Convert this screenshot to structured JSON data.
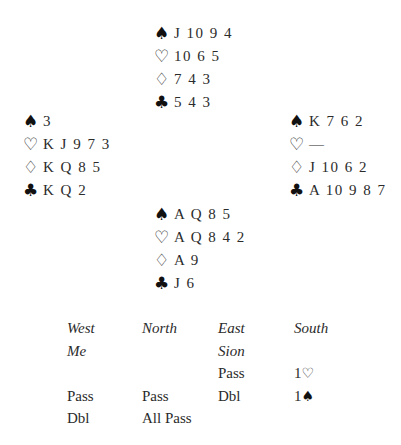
{
  "hands": {
    "north": {
      "spades": "J 10 9 4",
      "hearts": "10 6 5",
      "diamonds": "7 4 3",
      "clubs": "5 4 3"
    },
    "west": {
      "spades": "3",
      "hearts": "K J 9 7 3",
      "diamonds": "K Q 8 5",
      "clubs": "K Q 2"
    },
    "east": {
      "spades": "K 7 6 2",
      "hearts": "—",
      "diamonds": "J 10 6 2",
      "clubs": "A 10 9 8 7"
    },
    "south": {
      "spades": "A Q 8 5",
      "hearts": "A Q 8 4 2",
      "diamonds": "A 9",
      "clubs": "J 6"
    }
  },
  "suit_icons": {
    "spades": "♠",
    "hearts": "♡",
    "diamonds": "♢",
    "clubs": "♣"
  },
  "auction": {
    "headers": [
      "West",
      "North",
      "East",
      "South"
    ],
    "players": [
      "Me",
      "",
      "Sion",
      ""
    ],
    "rounds": [
      [
        "",
        "",
        "Pass",
        "1♡"
      ],
      [
        "Pass",
        "Pass",
        "Dbl",
        "1♠"
      ],
      [
        "Dbl",
        "All Pass",
        "",
        ""
      ]
    ],
    "bids_parsed": {
      "r1_south_level": "1",
      "r1_south_suit": "♡",
      "r2_south_level": "1",
      "r2_south_suit": "♠"
    }
  }
}
